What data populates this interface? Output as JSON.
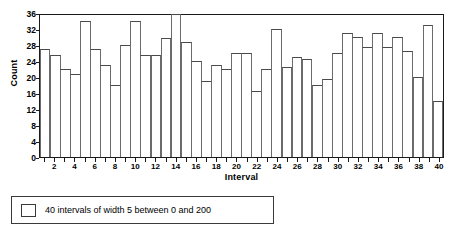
{
  "chart_data": {
    "type": "bar",
    "title": "",
    "xlabel": "Interval",
    "ylabel": "Count",
    "ylim": [
      0,
      36
    ],
    "ytick_values": [
      0,
      4,
      8,
      12,
      16,
      20,
      24,
      28,
      32,
      36
    ],
    "ytick_labels": [
      "0",
      "4",
      "8",
      "12",
      "16",
      "20",
      "24",
      "28",
      "32",
      "36"
    ],
    "xlim": [
      0.5,
      40.5
    ],
    "xtick_values": [
      2,
      4,
      6,
      8,
      10,
      12,
      14,
      16,
      18,
      20,
      22,
      24,
      26,
      28,
      30,
      32,
      34,
      36,
      38,
      40
    ],
    "xtick_labels": [
      "2",
      "4",
      "6",
      "8",
      "10",
      "12",
      "14",
      "16",
      "18",
      "20",
      "22",
      "24",
      "26",
      "28",
      "30",
      "32",
      "34",
      "36",
      "38",
      "40"
    ],
    "grid": false,
    "legend_position": "below-plot",
    "categories": [
      1,
      2,
      3,
      4,
      5,
      6,
      7,
      8,
      9,
      10,
      11,
      12,
      13,
      14,
      15,
      16,
      17,
      18,
      19,
      20,
      21,
      22,
      23,
      24,
      25,
      26,
      27,
      28,
      29,
      30,
      31,
      32,
      33,
      34,
      35,
      36,
      37,
      38,
      39,
      40
    ],
    "values": [
      27,
      25.5,
      22,
      20.8,
      34,
      27,
      23,
      18,
      28,
      34,
      25.5,
      25.5,
      29.8,
      35.8,
      28.8,
      24,
      19,
      23,
      22,
      26,
      26,
      16.5,
      22,
      32,
      22.5,
      25,
      24.5,
      18,
      19.5,
      26,
      31,
      30,
      27.5,
      31,
      27.5,
      30,
      26.5,
      20,
      33,
      14
    ],
    "bar_fill_color": "#ffffff",
    "bar_edge_color": "#4a4a4a",
    "legend_entries": [
      {
        "label": "40 intervals of width 5 between 0 and 200",
        "swatch_fill": "#ffffff",
        "swatch_edge": "#3a3a3a"
      }
    ]
  }
}
